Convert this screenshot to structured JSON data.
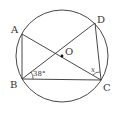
{
  "diagram": {
    "type": "circle-geometry",
    "circle": {
      "center": "O",
      "cx": 62,
      "cy": 56,
      "r": 46
    },
    "points": {
      "A": {
        "label": "A",
        "x": 22,
        "y": 34
      },
      "B": {
        "label": "B",
        "x": 22,
        "y": 79
      },
      "C": {
        "label": "C",
        "x": 101,
        "y": 80
      },
      "D": {
        "label": "D",
        "x": 95,
        "y": 23
      },
      "O": {
        "label": "O",
        "x": 62,
        "y": 56
      }
    },
    "segments": [
      "AB",
      "AC",
      "BD",
      "BC",
      "CD"
    ],
    "angles": {
      "DBC": {
        "label": "38°"
      },
      "ACD": {
        "label": "x"
      }
    },
    "colors": {
      "stroke": "#333333",
      "background": "#ffffff"
    }
  }
}
